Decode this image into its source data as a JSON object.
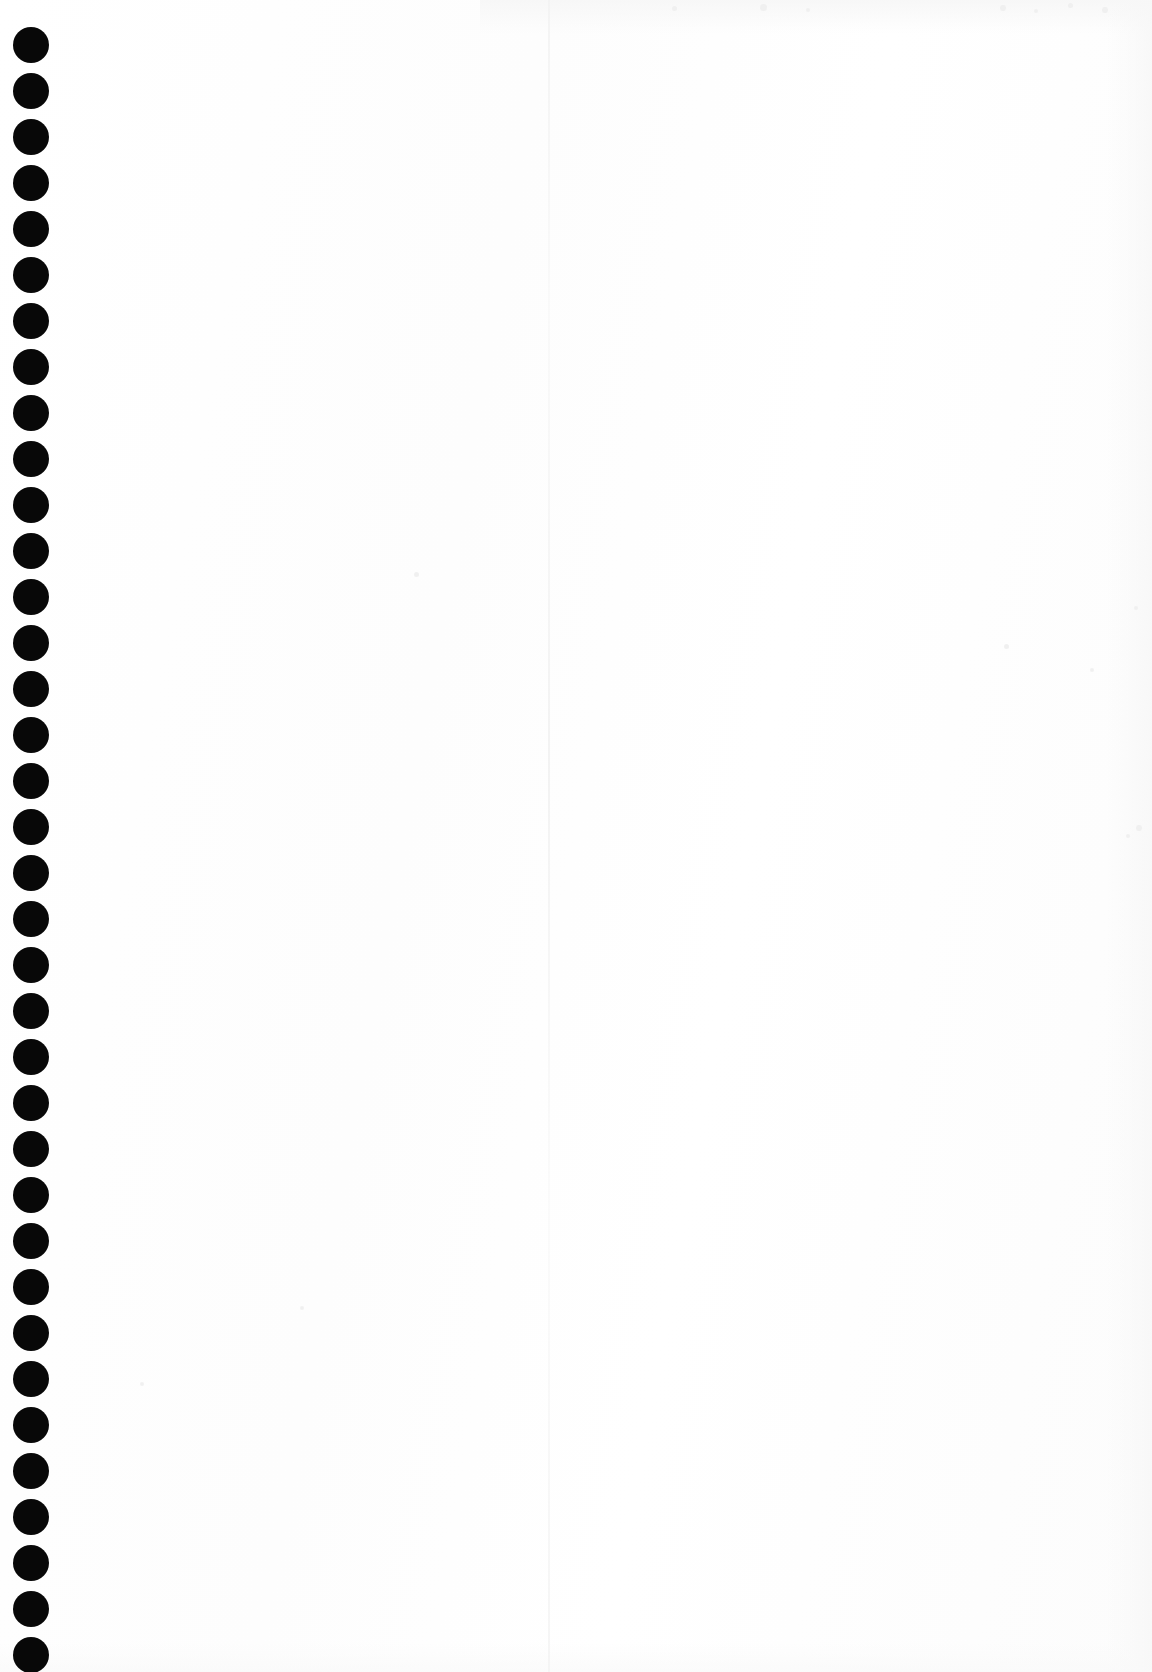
{
  "page": {
    "kind": "scanned-blank-notebook-page",
    "width": 1152,
    "height": 1672,
    "background_color": "#fefefe",
    "paper_tone_color": "#fdfdfd",
    "content_text": "",
    "visible_text_count": 0
  },
  "binding": {
    "name": "spiral-binding-holes",
    "hole_color": "#080808",
    "hole_count": 36,
    "hole_diameter": 36,
    "hole_spacing": 46,
    "first_hole_top": 27,
    "hole_left": 13,
    "holes": [
      {
        "index": 1,
        "top": 27
      },
      {
        "index": 2,
        "top": 73
      },
      {
        "index": 3,
        "top": 119
      },
      {
        "index": 4,
        "top": 165
      },
      {
        "index": 5,
        "top": 211
      },
      {
        "index": 6,
        "top": 257
      },
      {
        "index": 7,
        "top": 303
      },
      {
        "index": 8,
        "top": 349
      },
      {
        "index": 9,
        "top": 395
      },
      {
        "index": 10,
        "top": 441
      },
      {
        "index": 11,
        "top": 487
      },
      {
        "index": 12,
        "top": 533
      },
      {
        "index": 13,
        "top": 579
      },
      {
        "index": 14,
        "top": 625
      },
      {
        "index": 15,
        "top": 671
      },
      {
        "index": 16,
        "top": 717
      },
      {
        "index": 17,
        "top": 763
      },
      {
        "index": 18,
        "top": 809
      },
      {
        "index": 19,
        "top": 855
      },
      {
        "index": 20,
        "top": 901
      },
      {
        "index": 21,
        "top": 947
      },
      {
        "index": 22,
        "top": 993
      },
      {
        "index": 23,
        "top": 1039
      },
      {
        "index": 24,
        "top": 1085
      },
      {
        "index": 25,
        "top": 1131
      },
      {
        "index": 26,
        "top": 1177
      },
      {
        "index": 27,
        "top": 1223
      },
      {
        "index": 28,
        "top": 1269
      },
      {
        "index": 29,
        "top": 1315
      },
      {
        "index": 30,
        "top": 1361
      },
      {
        "index": 31,
        "top": 1407
      },
      {
        "index": 32,
        "top": 1453
      },
      {
        "index": 33,
        "top": 1499
      },
      {
        "index": 34,
        "top": 1545
      },
      {
        "index": 35,
        "top": 1591
      },
      {
        "index": 36,
        "top": 1637
      }
    ]
  },
  "fold_line": {
    "name": "page-fold-line",
    "left": 548,
    "width": 2,
    "color": "#f4f4f4"
  },
  "speckles": [
    {
      "left": 672,
      "top": 6,
      "size": 5
    },
    {
      "left": 760,
      "top": 4,
      "size": 7
    },
    {
      "left": 806,
      "top": 8,
      "size": 4
    },
    {
      "left": 1000,
      "top": 5,
      "size": 6
    },
    {
      "left": 1034,
      "top": 9,
      "size": 4
    },
    {
      "left": 1068,
      "top": 3,
      "size": 5
    },
    {
      "left": 1102,
      "top": 7,
      "size": 6
    },
    {
      "left": 1004,
      "top": 644,
      "size": 5
    },
    {
      "left": 1134,
      "top": 606,
      "size": 4
    },
    {
      "left": 1090,
      "top": 668,
      "size": 4
    },
    {
      "left": 1136,
      "top": 825,
      "size": 6
    },
    {
      "left": 1126,
      "top": 834,
      "size": 4
    },
    {
      "left": 414,
      "top": 572,
      "size": 5
    },
    {
      "left": 300,
      "top": 1306,
      "size": 4
    },
    {
      "left": 140,
      "top": 1382,
      "size": 4
    }
  ]
}
